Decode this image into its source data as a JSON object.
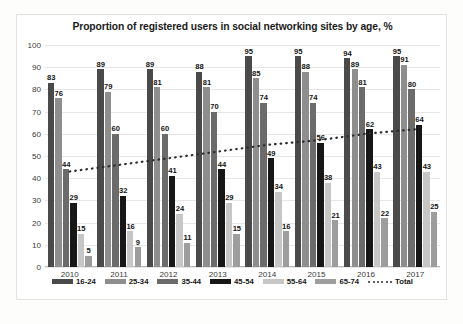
{
  "chart_data": {
    "type": "bar",
    "title": "Proportion of registered users in social networking sites by age, %",
    "xlabel": "",
    "ylabel": "",
    "ylim": [
      0,
      100
    ],
    "ytick_step": 10,
    "yticks": [
      "100",
      "90",
      "80",
      "70",
      "60",
      "50",
      "40",
      "30",
      "20",
      "10",
      "0"
    ],
    "grid": true,
    "legend_position": "bottom",
    "categories": [
      "2010",
      "2011",
      "2012",
      "2013",
      "2014",
      "2015",
      "2016",
      "2017"
    ],
    "series": [
      {
        "name": "16-24",
        "color": "#4a4a4a",
        "values": [
          83,
          89,
          89,
          88,
          95,
          95,
          94,
          95
        ]
      },
      {
        "name": "25-34",
        "color": "#8e8e8e",
        "values": [
          76,
          79,
          81,
          81,
          85,
          88,
          89,
          91
        ]
      },
      {
        "name": "35-44",
        "color": "#6b6b6b",
        "values": [
          44,
          60,
          60,
          70,
          74,
          74,
          81,
          80
        ]
      },
      {
        "name": "45-54",
        "color": "#171717",
        "values": [
          29,
          32,
          41,
          44,
          49,
          56,
          62,
          64
        ]
      },
      {
        "name": "55-64",
        "color": "#c6c6c6",
        "values": [
          15,
          16,
          24,
          29,
          34,
          38,
          43,
          43
        ]
      },
      {
        "name": "65-74",
        "color": "#9d9d9d",
        "values": [
          5,
          9,
          11,
          15,
          16,
          21,
          22,
          25
        ]
      },
      {
        "name": "Total",
        "color": "#2b2b2b",
        "style": "dotted-trendline",
        "values": [
          43,
          46,
          49,
          52,
          55,
          57,
          60,
          62
        ]
      }
    ],
    "caption": ""
  }
}
